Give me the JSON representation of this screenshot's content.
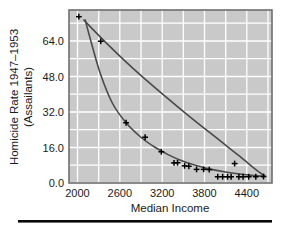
{
  "figure": {
    "name": "homicide-rate-vs-median-income-scatter",
    "background_color": "#ffffff",
    "plot_background_color": "#c9c9c9",
    "grid_color": "#ffffff",
    "frame_color": "#6e6e6e",
    "curve_color": "#4a4a4a",
    "marker_color": "#000000",
    "rule_color": "#0a0a0a"
  },
  "chart_data": {
    "type": "scatter",
    "title": "",
    "xlabel": "Median Income",
    "ylabel": "Homicide Rate 1947–1953 (Assailants)",
    "ylabel_line1": "Homicide Rate 1947–1953",
    "ylabel_line2": "(Assailants)",
    "xlim": [
      1880,
      4760
    ],
    "ylim": [
      -2.5,
      75.0
    ],
    "xticks": [
      2000,
      2600,
      3200,
      3800,
      4400
    ],
    "xticklabels": [
      "2000",
      "2600",
      "3200",
      "3800",
      "4400"
    ],
    "yticks": [
      0.0,
      16.0,
      32.0,
      48.0,
      64.0
    ],
    "yticklabels": [
      "0.0",
      "16.0",
      "32.0",
      "48.0",
      "64.0"
    ],
    "xgrid_values": [
      2000,
      2300,
      2600,
      2900,
      3200,
      3500,
      3800,
      4100,
      4400,
      4700
    ],
    "ygrid_values": [
      0.0,
      8.0,
      16.0,
      24.0,
      32.0,
      40.0,
      48.0,
      56.0,
      64.0,
      72.0
    ],
    "grid": true,
    "legend": "none",
    "series": [
      {
        "name": "observations",
        "marker": "plus",
        "x": [
          2020,
          2330,
          2690,
          2960,
          3190,
          3370,
          3420,
          3520,
          3580,
          3690,
          3790,
          3870,
          3990,
          4060,
          4130,
          4180,
          4230,
          4290,
          4350,
          4430,
          4530,
          4640
        ],
        "y": [
          72.0,
          61.0,
          24.5,
          18.0,
          11.5,
          6.5,
          6.6,
          5.2,
          5.0,
          3.6,
          3.6,
          3.5,
          0.3,
          0.3,
          0.3,
          0.3,
          6.2,
          0.3,
          0.3,
          0.3,
          0.3,
          0.4
        ]
      }
    ],
    "curves": [
      {
        "name": "exponential-decay-fit",
        "description": "steeply decaying fitted curve through the data points",
        "x": [
          2110,
          2200,
          2330,
          2500,
          2690,
          2900,
          3100,
          3300,
          3500,
          3700,
          3900,
          4100,
          4300,
          4500,
          4660
        ],
        "y": [
          70.5,
          60.0,
          46.0,
          33.0,
          24.5,
          18.0,
          13.5,
          10.0,
          7.2,
          5.2,
          3.6,
          2.4,
          1.5,
          0.8,
          0.4
        ]
      },
      {
        "name": "shallow-fit-line",
        "description": "gently curving near-linear fit from upper left to lower right",
        "x": [
          2090,
          2400,
          2800,
          3200,
          3600,
          4000,
          4300,
          4550,
          4660
        ],
        "y": [
          70.5,
          60.5,
          48.5,
          37.5,
          27.0,
          17.0,
          9.5,
          3.0,
          0.6
        ]
      }
    ]
  },
  "bottom_rule": {
    "name": "horizontal-rule",
    "visible": true
  }
}
